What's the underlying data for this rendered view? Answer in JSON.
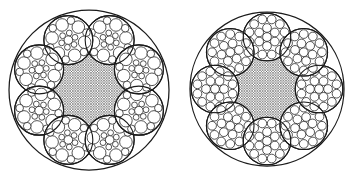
{
  "figure": {
    "type": "diagram",
    "background": "#ffffff",
    "line_color": "#1b1b1b",
    "wire_fill": "#ffffff",
    "hatch": {
      "cell": 2.6,
      "color": "#555555",
      "line_width": 0.55
    },
    "stroke_widths": {
      "outer": 1.25,
      "strand": 1.1,
      "wire": 0.75
    },
    "pattern_base_strand_radius": 24.5,
    "patterns": {
      "warrington": {
        "rings": [
          {
            "count": 1,
            "ring": 0,
            "r": 4.3,
            "angle0": 0
          },
          {
            "count": 6,
            "ring": 7.2,
            "r": 2.9,
            "angle0": 30
          },
          {
            "count": 6,
            "ring": 16.4,
            "r": 6.3,
            "angle0": 0
          },
          {
            "count": 6,
            "ring": 19.6,
            "r": 3.8,
            "angle0": 30
          }
        ]
      },
      "uniform19": {
        "rings": [
          {
            "count": 1,
            "ring": 0,
            "r": 4.5,
            "angle0": 0
          },
          {
            "count": 6,
            "ring": 9.3,
            "r": 4.5,
            "angle0": 0
          },
          {
            "count": 12,
            "ring": 18.7,
            "r": 4.5,
            "angle0": 15
          }
        ]
      }
    },
    "ropes": [
      {
        "name": "left-rope-cross-section",
        "cx": 89,
        "cy": 90,
        "outer_radius": 80,
        "core_radius": 56,
        "strand_count": 8,
        "strand_ring_radius": 54,
        "strand_radius": 24.5,
        "strand_angle_offset_deg": 67.5,
        "strand_pattern": "warrington"
      },
      {
        "name": "right-rope-cross-section",
        "cx": 267,
        "cy": 89,
        "outer_radius": 77,
        "core_radius": 54,
        "strand_count": 8,
        "strand_ring_radius": 52,
        "strand_radius": 23.8,
        "strand_angle_offset_deg": 90,
        "strand_pattern": "uniform19"
      }
    ]
  }
}
